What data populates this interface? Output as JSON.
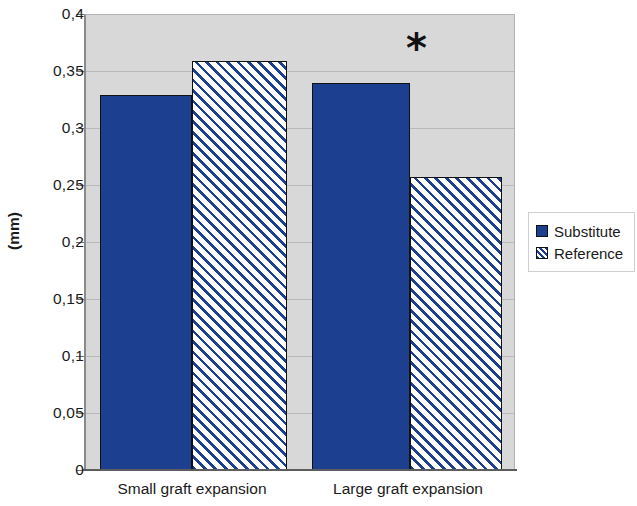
{
  "chart_data": {
    "type": "bar",
    "title": "",
    "subtitle": "",
    "xlabel": "",
    "ylabel": "(mm)",
    "categories": [
      "Small graft expansion",
      "Large graft expansion"
    ],
    "series": [
      {
        "name": "Substitute",
        "values": [
          0.33,
          0.34
        ],
        "color": "#1c3f8f",
        "fill": "solid"
      },
      {
        "name": "Reference",
        "values": [
          0.36,
          0.258
        ],
        "color": "#1c3f8f",
        "fill": "diagonal-hatch"
      }
    ],
    "ylim": [
      0,
      0.4
    ],
    "ytick_values": [
      0,
      0.05,
      0.1,
      0.15,
      0.2,
      0.25,
      0.3,
      0.35,
      0.4
    ],
    "ytick_labels": [
      "0",
      "0,05",
      "0,1",
      "0,15",
      "0,2",
      "0,25",
      "0,3",
      "0,35",
      "0,4"
    ],
    "grid": true,
    "grid_axis": "y",
    "legend_position": "right",
    "plot_background": "#d8d8d8",
    "annotations": [
      {
        "text": "*",
        "series_group": "Large graft expansion",
        "meaning": "significant-difference"
      }
    ]
  },
  "legend": {
    "items": [
      {
        "label": "Substitute",
        "swatch": "solid-swatch"
      },
      {
        "label": "Reference",
        "swatch": "hatched-swatch"
      }
    ]
  },
  "axis": {
    "y_title": "(mm)"
  }
}
